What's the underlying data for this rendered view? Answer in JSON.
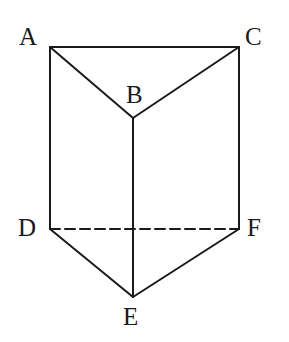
{
  "figure": {
    "name": "triangular-prism",
    "background_color": "#ffffff",
    "stroke_color": "#1a1a1a",
    "stroke_width": 2,
    "width": 289,
    "height": 342
  },
  "vertices": [
    {
      "id": "A",
      "label": "A",
      "x": 50,
      "y": 47,
      "label_x": 19,
      "label_y": 24
    },
    {
      "id": "B",
      "label": "B",
      "x": 133,
      "y": 118,
      "label_x": 126,
      "label_y": 82
    },
    {
      "id": "C",
      "label": "C",
      "x": 239,
      "y": 47,
      "label_x": 245,
      "label_y": 24
    },
    {
      "id": "D",
      "label": "D",
      "x": 50,
      "y": 229,
      "label_x": 18,
      "label_y": 215
    },
    {
      "id": "E",
      "label": "E",
      "x": 133,
      "y": 297,
      "label_x": 123,
      "label_y": 304
    },
    {
      "id": "F",
      "label": "F",
      "x": 239,
      "y": 229,
      "label_x": 247,
      "label_y": 215
    }
  ],
  "edges": [
    {
      "id": "edge-AC",
      "from": "A",
      "to": "C",
      "style": "solid",
      "x1": 50,
      "y1": 47,
      "x2": 239,
      "y2": 47
    },
    {
      "id": "edge-AB",
      "from": "A",
      "to": "B",
      "style": "solid",
      "x1": 50,
      "y1": 47,
      "x2": 133,
      "y2": 118
    },
    {
      "id": "edge-CB",
      "from": "C",
      "to": "B",
      "style": "solid",
      "x1": 239,
      "y1": 47,
      "x2": 133,
      "y2": 118
    },
    {
      "id": "edge-AD",
      "from": "A",
      "to": "D",
      "style": "solid",
      "x1": 50,
      "y1": 47,
      "x2": 50,
      "y2": 229
    },
    {
      "id": "edge-CF",
      "from": "C",
      "to": "F",
      "style": "solid",
      "x1": 239,
      "y1": 47,
      "x2": 239,
      "y2": 229
    },
    {
      "id": "edge-BE",
      "from": "B",
      "to": "E",
      "style": "solid",
      "x1": 133,
      "y1": 118,
      "x2": 133,
      "y2": 297
    },
    {
      "id": "edge-DE",
      "from": "D",
      "to": "E",
      "style": "solid",
      "x1": 50,
      "y1": 229,
      "x2": 133,
      "y2": 297
    },
    {
      "id": "edge-FE",
      "from": "F",
      "to": "E",
      "style": "solid",
      "x1": 239,
      "y1": 229,
      "x2": 133,
      "y2": 297
    },
    {
      "id": "edge-DF",
      "from": "D",
      "to": "F",
      "style": "dashed",
      "x1": 50,
      "y1": 229,
      "x2": 239,
      "y2": 229,
      "dash_pattern": "10 5"
    }
  ]
}
